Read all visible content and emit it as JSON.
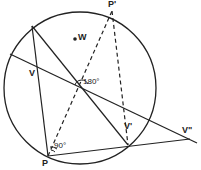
{
  "diagram": {
    "circle": {
      "cx": 80,
      "cy": 88,
      "r": 76
    },
    "points": {
      "W": {
        "label": "W",
        "x": 75,
        "y": 39
      },
      "P_prime": {
        "label": "P'",
        "x": 112,
        "y": 11
      },
      "P": {
        "label": "P",
        "x": 48,
        "y": 156
      },
      "V": {
        "label": "V",
        "x": 36,
        "y": 68
      },
      "V_prime": {
        "label": "V'",
        "x": 122,
        "y": 127
      },
      "V_double_prime": {
        "label": "V\"",
        "x": 190,
        "y": 139
      },
      "A": {
        "x": 32,
        "y": 26
      },
      "B": {
        "x": 128,
        "y": 145
      },
      "O": {
        "x": 82,
        "y": 93
      }
    },
    "angles": {
      "center_angle": "180°",
      "p_angle": "90°"
    }
  },
  "labels": {
    "W": "W",
    "P_prime": "P'",
    "P": "P",
    "V": "V",
    "V_prime": "V'",
    "V_double_prime": "V\"",
    "angle_180": "180°",
    "angle_90": "90°"
  }
}
